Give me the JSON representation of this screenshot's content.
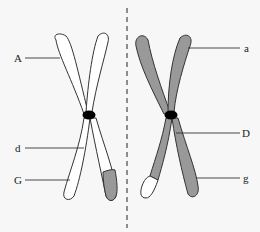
{
  "diagram": {
    "type": "homologous-chromosome-pair",
    "left_chromosome": {
      "fill": "#ffffff",
      "tip_fill": "#999999",
      "labels": [
        {
          "text": "A",
          "position": "upper-left arm"
        },
        {
          "text": "d",
          "position": "lower-left arm near centromere"
        },
        {
          "text": "G",
          "position": "lower-left arm"
        }
      ]
    },
    "right_chromosome": {
      "fill": "#999999",
      "tip_fill": "#ffffff",
      "labels": [
        {
          "text": "a",
          "position": "upper-right arm"
        },
        {
          "text": "D",
          "position": "lower-right arm near centromere"
        },
        {
          "text": "g",
          "position": "lower-right arm"
        }
      ]
    },
    "centromere_color": "#000000",
    "divider": "dashed vertical line"
  },
  "labels": {
    "A": "A",
    "d": "d",
    "G": "G",
    "a": "a",
    "D": "D",
    "g": "g"
  }
}
